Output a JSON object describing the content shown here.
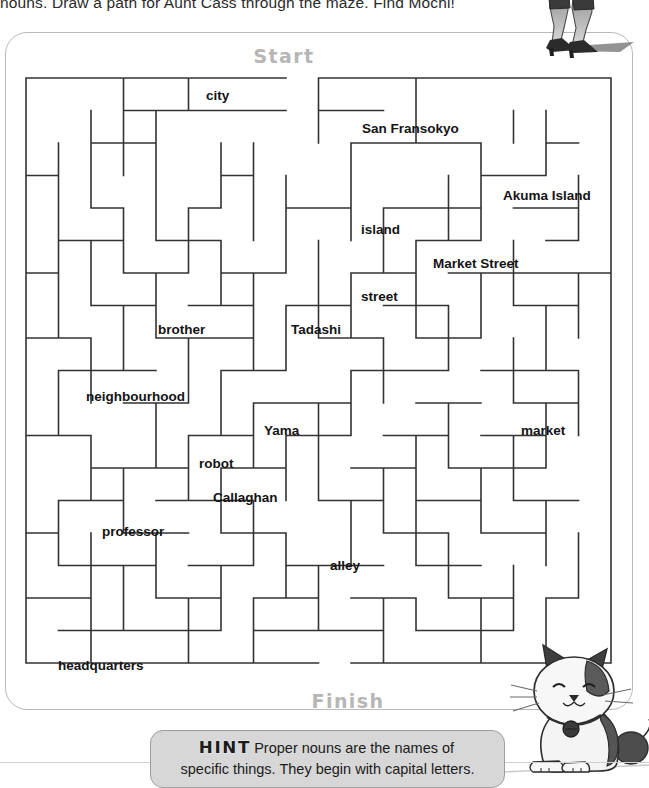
{
  "instruction": "nouns. Draw a path for Aunt Cass through the maze. Find Mochi!",
  "maze": {
    "start_label": "Start",
    "finish_label": "Finish",
    "cols": 18,
    "rows": 18,
    "cell": 32.5,
    "origin_x": 26,
    "origin_y": 78,
    "stroke": "#333333",
    "stroke_width": 1.6,
    "start_gap": {
      "col": 8,
      "edge": "top"
    },
    "finish_gap": {
      "col": 9,
      "edge": "bottom"
    },
    "words": [
      {
        "text": "city",
        "type": "common",
        "x": 206,
        "y": 89
      },
      {
        "text": "San Fransokyo",
        "type": "proper",
        "x": 362,
        "y": 122
      },
      {
        "text": "Akuma Island",
        "type": "proper",
        "x": 503,
        "y": 189
      },
      {
        "text": "island",
        "type": "common",
        "x": 361,
        "y": 223
      },
      {
        "text": "Market Street",
        "type": "proper",
        "x": 433,
        "y": 257
      },
      {
        "text": "street",
        "type": "common",
        "x": 361,
        "y": 290
      },
      {
        "text": "brother",
        "type": "common",
        "x": 158,
        "y": 323
      },
      {
        "text": "Tadashi",
        "type": "proper",
        "x": 291,
        "y": 323
      },
      {
        "text": "neighbourhood",
        "type": "common",
        "x": 86,
        "y": 390
      },
      {
        "text": "Yama",
        "type": "proper",
        "x": 264,
        "y": 424
      },
      {
        "text": "market",
        "type": "common",
        "x": 521,
        "y": 424
      },
      {
        "text": "robot",
        "type": "common",
        "x": 199,
        "y": 457
      },
      {
        "text": "Callaghan",
        "type": "proper",
        "x": 213,
        "y": 491
      },
      {
        "text": "professor",
        "type": "common",
        "x": 102,
        "y": 525
      },
      {
        "text": "alley",
        "type": "common",
        "x": 330,
        "y": 559
      },
      {
        "text": "headquarters",
        "type": "common",
        "x": 58,
        "y": 659
      }
    ]
  },
  "hint": {
    "badge": "HINT",
    "text_line1": "Proper nouns are the names of",
    "text_line2": "specific things. They begin with capital letters."
  },
  "artwork": {
    "legs": "aunt-cass-legs-illustration",
    "cat": "mochi-cat-illustration"
  },
  "colors": {
    "maze_wall": "#333333",
    "marker_gray": "#b6b6b6",
    "card_border": "#b9b9b9",
    "hint_fill": "#d7d7d7"
  }
}
